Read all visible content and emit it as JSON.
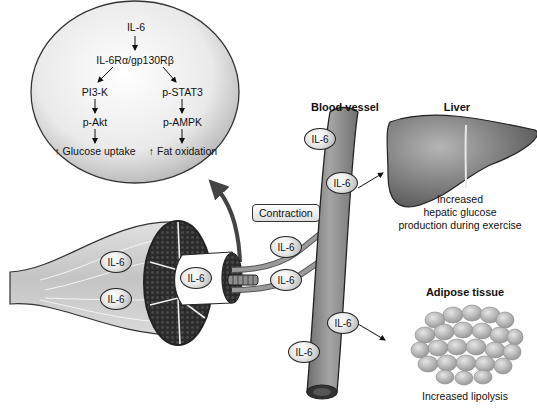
{
  "signaling": {
    "top": "IL-6",
    "receptor": "IL-6Rα/gp130Rβ",
    "left_path": [
      "PI3-K",
      "p-Akt",
      "↑ Glucose uptake"
    ],
    "right_path": [
      "p-STAT3",
      "p-AMPK",
      "↑ Fat oxidation"
    ]
  },
  "labels": {
    "blood_vessel": "Blood vessel",
    "liver": "Liver",
    "liver_effect": [
      "Increased",
      "hepatic glucose",
      "production during exercise"
    ],
    "adipose": "Adipose tissue",
    "adipose_effect": "Increased lipolysis",
    "contraction": "Contraction"
  },
  "markers": {
    "il6": "IL-6",
    "muscle_1": "IL-6",
    "muscle_2": "IL-6",
    "fiber": "IL-6",
    "capillary_1": "IL-6",
    "capillary_2": "IL-6",
    "vessel_1": "IL-6",
    "vessel_2": "IL-6",
    "vessel_3": "IL-6",
    "vessel_4": "IL-6"
  },
  "colors": {
    "bubble": "#dcdcdc",
    "vessel": "#8c8c8c",
    "liver": "#7a7a7a",
    "muscle": "#d0d0d0",
    "fascicle": "#2a2a2a"
  }
}
